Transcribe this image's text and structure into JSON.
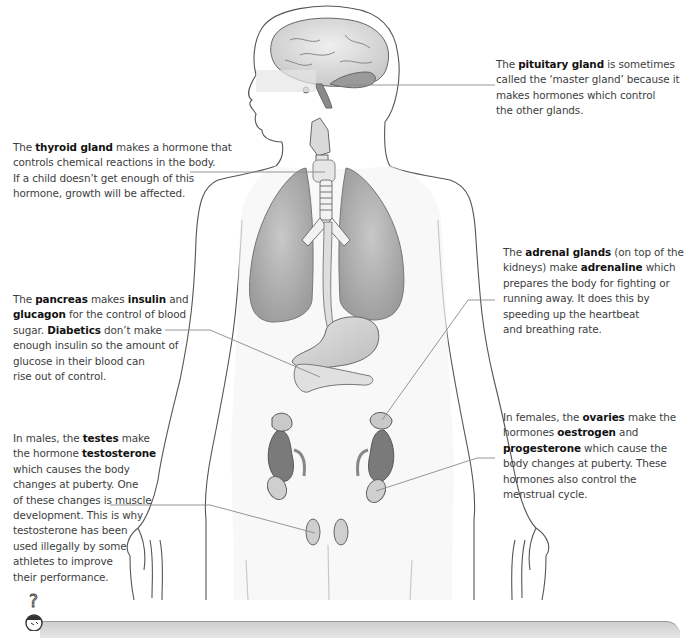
{
  "diagram": {
    "colors": {
      "outline": "#555555",
      "lung_fill": "#a9a9a9",
      "kidney_fill": "#7a7a7a",
      "gland_fill": "#cfcfcf",
      "pointer_line": "#8a8a8a",
      "body_fill": "#f8f8f8"
    }
  },
  "callouts": {
    "pituitary": {
      "intro": "The ",
      "term": "pituitary gland",
      "rest_line1": " is sometimes",
      "line2": "called the ‘master gland’ because it",
      "line3": "makes hormones which control",
      "line4": "the other glands."
    },
    "thyroid": {
      "intro": "The ",
      "term": "thyroid gland",
      "rest_line1": " makes a hormone that",
      "line2": "controls chemical reactions in the body.",
      "line3": "If a child doesn’t get enough of this",
      "line4": "hormone, growth will be affected."
    },
    "adrenal": {
      "intro": "The ",
      "term": "adrenal glands",
      "rest_line1": " (on top of the",
      "line2_a": "kidneys) make ",
      "line2_term": "adrenaline",
      "line2_b": " which",
      "line3": "prepares the body for fighting or",
      "line4": "running away. It does this by",
      "line5": "speeding up the heartbeat",
      "line6": "and breathing rate."
    },
    "pancreas": {
      "intro": "The ",
      "term": "pancreas",
      "mid": " makes ",
      "term2": "insulin",
      "rest_line1": " and",
      "line2_term": "glucagon",
      "line2_rest": " for the control of blood",
      "line3_a": "sugar. ",
      "line3_term": "Diabetics",
      "line3_b": " don’t make",
      "line4": "enough insulin so the amount of",
      "line5": "glucose in their blood can",
      "line6": "rise out of control."
    },
    "testes": {
      "line1_a": "In males, the ",
      "line1_term": "testes",
      "line1_b": " make",
      "line2_a": "the hormone ",
      "line2_term": "testosterone",
      "line3": "which causes the body",
      "line4": "changes at puberty. One",
      "line5": "of these changes is muscle",
      "line6": "development. This is why",
      "line7": "testosterone has been",
      "line8": "used illegally by some",
      "line9": "athletes to improve",
      "line10": "their performance."
    },
    "ovaries": {
      "line1_a": "In females, the ",
      "line1_term": "ovaries",
      "line1_b": " make the",
      "line2_a": "hormones ",
      "line2_term": "oestrogen",
      "line2_b": " and",
      "line3_term": "progesterone",
      "line3_b": " which cause the",
      "line4": "body changes at puberty. These",
      "line5": "hormones also control the",
      "line6": "menstrual cycle."
    }
  },
  "footer": {
    "mascot_icon": "question-mark-thinking-face-icon",
    "question_mark": "?"
  }
}
